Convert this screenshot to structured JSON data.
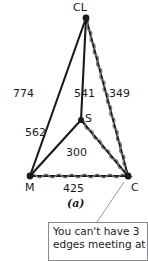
{
  "figure": {
    "caption": "(a)",
    "nodes": [
      {
        "id": "CL",
        "label": "CL",
        "x": 86,
        "y": 18
      },
      {
        "id": "M",
        "label": "M",
        "x": 30,
        "y": 176
      },
      {
        "id": "C",
        "label": "C",
        "x": 128,
        "y": 176
      },
      {
        "id": "S",
        "label": "S",
        "x": 81,
        "y": 120
      }
    ],
    "edges": [
      {
        "from": "CL",
        "to": "M",
        "weight": "774",
        "style": "plain"
      },
      {
        "from": "CL",
        "to": "S",
        "weight": "541",
        "style": "plain"
      },
      {
        "from": "CL",
        "to": "C",
        "weight": "349",
        "style": "wavy"
      },
      {
        "from": "M",
        "to": "S",
        "weight": "562",
        "style": "plain"
      },
      {
        "from": "S",
        "to": "C",
        "weight": "300",
        "style": "wavy"
      },
      {
        "from": "M",
        "to": "C",
        "weight": "425",
        "style": "wavy"
      }
    ]
  },
  "callout": {
    "lines": [
      "You can't have 3",
      "edges meeting at"
    ],
    "target_node": "C"
  },
  "colors": {
    "ink": "#1a1a1a",
    "wave": "#7d7d7d",
    "callout_border": "#8a8a8a",
    "leader": "#9a9a9a",
    "background": "#ffffff"
  }
}
